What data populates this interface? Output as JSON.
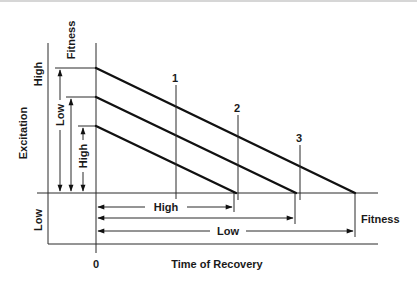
{
  "figure": {
    "top_border_color": "#c8c8c8",
    "labels": {
      "y_axis_title": "Excitation",
      "y_high": "High",
      "y_low": "Low",
      "fitness_top": "Fitness",
      "fitness_right": "Fitness",
      "x_axis_title": "Time of Recovery",
      "origin": "0",
      "vertical_low_arrow": "Low",
      "vertical_high_arrow": "High",
      "horizontal_high_arrow": "High",
      "horizontal_low_arrow": "Low"
    },
    "curves": [
      {
        "id": "1",
        "label": "1",
        "start_level": "high fitness / high excitation",
        "recovery_end": "longest"
      },
      {
        "id": "2",
        "label": "2",
        "start_level": "medium",
        "recovery_end": "medium"
      },
      {
        "id": "3",
        "label": "3",
        "start_level": "low",
        "recovery_end": "shortest"
      }
    ],
    "markers": [
      "1",
      "2",
      "3"
    ]
  }
}
